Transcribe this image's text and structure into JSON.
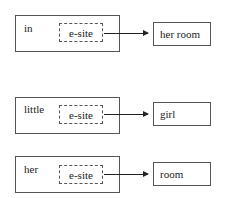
{
  "diagrams": [
    {
      "word": "in",
      "site_label": "e-site",
      "target": "her room"
    },
    {
      "word": "little",
      "site_label": "e-site",
      "target": "girl"
    },
    {
      "word": "her",
      "site_label": "e-site",
      "target": "room"
    }
  ]
}
